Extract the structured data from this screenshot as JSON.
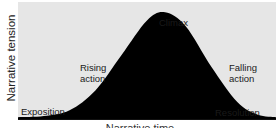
{
  "chart_data": {
    "type": "area",
    "title": "",
    "ylabel": "Narrative tension",
    "xlabel": "Narrative time",
    "curve": {
      "x": [
        0,
        0.1,
        0.2,
        0.3,
        0.4,
        0.5,
        0.57,
        0.65,
        0.75,
        0.85,
        0.93,
        1.0
      ],
      "y": [
        0.02,
        0.03,
        0.08,
        0.25,
        0.55,
        0.85,
        0.92,
        0.8,
        0.45,
        0.15,
        0.04,
        0.02
      ]
    },
    "annotations": [
      {
        "id": "exposition",
        "text": "Exposition"
      },
      {
        "id": "rising",
        "lines": [
          "Rising",
          "action"
        ]
      },
      {
        "id": "climax",
        "text": "Climax"
      },
      {
        "id": "falling",
        "lines": [
          "Falling",
          "action"
        ]
      },
      {
        "id": "resolution",
        "text": "Resolution"
      }
    ],
    "colors": {
      "background": "#e6e6e6",
      "fill": "#000000"
    }
  }
}
